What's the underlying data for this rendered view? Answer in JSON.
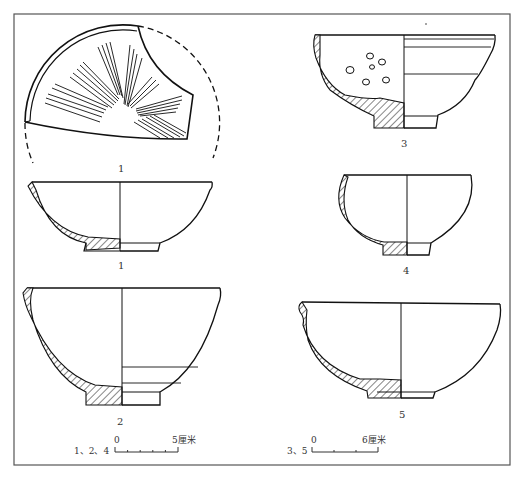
{
  "figure": {
    "type": "archaeological line drawing plate",
    "frame_color": "#555555",
    "line_color": "#111111"
  },
  "items": [
    {
      "id": "1",
      "label": "1",
      "view": "top view of fragment with radiating decoration",
      "view_label": "1"
    },
    {
      "id": "1s",
      "label": "1",
      "view": "section / profile"
    },
    {
      "id": "2",
      "label": "2",
      "view": "section / profile, two incised lines near base"
    },
    {
      "id": "3",
      "label": "3",
      "view": "section / profile, interior dots, exterior bands"
    },
    {
      "id": "4",
      "label": "4",
      "view": "section / profile"
    },
    {
      "id": "5",
      "label": "5",
      "view": "section / profile"
    }
  ],
  "labels": {
    "fig1_top": "1",
    "fig1": "1",
    "fig2": "2",
    "fig3": "3",
    "fig4": "4",
    "fig5": "5"
  },
  "scales": [
    {
      "applies_to": "1、2、4",
      "zero": "0",
      "end": "5厘米",
      "ticks": 5
    },
    {
      "applies_to": "3、5",
      "zero": "0",
      "end": "6厘米",
      "ticks": 3
    }
  ]
}
